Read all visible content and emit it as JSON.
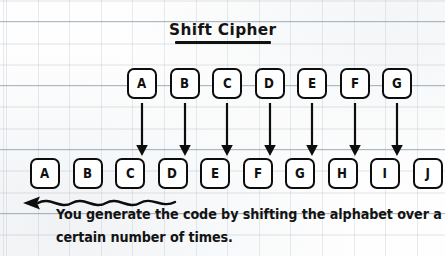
{
  "title": {
    "text": "Shift Cipher"
  },
  "diagram": {
    "top_row": {
      "label": "plaintext-alphabet-row",
      "letters": [
        "A",
        "B",
        "C",
        "D",
        "E",
        "F",
        "G"
      ]
    },
    "bottom_row": {
      "label": "ciphertext-alphabet-row",
      "letters": [
        "A",
        "B",
        "C",
        "D",
        "E",
        "F",
        "G",
        "H",
        "I",
        "J"
      ]
    },
    "mapping_arrows": {
      "count": 7,
      "direction": "down",
      "from": [
        "A",
        "B",
        "C",
        "D",
        "E",
        "F",
        "G"
      ],
      "to": [
        "D",
        "E",
        "F",
        "G",
        "H",
        "I",
        "J"
      ],
      "shift": 3
    },
    "shift_arrow": {
      "direction": "left",
      "style": "wavy"
    }
  },
  "caption": {
    "line1": "You generate the code by shifting the alphabet over a",
    "line2": "certain number of times."
  },
  "colors": {
    "ink": "#0d0d0d",
    "paper": "#fefefe",
    "grid_line": "#8494a6"
  }
}
